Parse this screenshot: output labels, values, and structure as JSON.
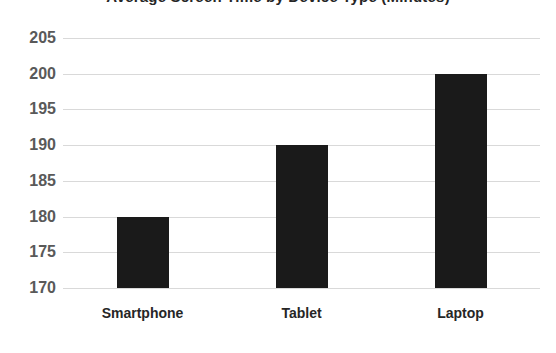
{
  "chart_data": {
    "type": "bar",
    "title": "Average Screen Time by Device Type (Minutes)",
    "title_clipped": true,
    "categories": [
      "Smartphone",
      "Tablet",
      "Laptop"
    ],
    "values": [
      180,
      190,
      200
    ],
    "series": [
      {
        "name": "Value",
        "values": [
          180,
          190,
          200
        ],
        "color": "#1a1a1a"
      }
    ],
    "xlabel": "",
    "ylabel": "",
    "ylim": [
      170,
      205
    ],
    "ytick_step": 5,
    "yticks": [
      205,
      200,
      195,
      190,
      185,
      180,
      175,
      170
    ],
    "ytick_labels": [
      "205",
      "200",
      "195",
      "190",
      "185",
      "180",
      "175",
      "170"
    ],
    "grid": true,
    "grid_axis": "y",
    "grid_color": "#d9d9d9",
    "legend": false,
    "legend_position": "none",
    "bar_color": "#1a1a1a",
    "background_color": "#ffffff",
    "ytick_label_color": "#595959",
    "xtick_label_color": "#262626"
  }
}
